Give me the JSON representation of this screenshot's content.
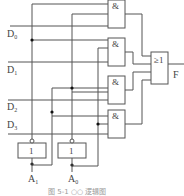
{
  "figure": {
    "caption": "图 5-1  ○○ 逻辑图",
    "colors": {
      "line": "#555555",
      "text": "#444444",
      "caption": "#9a9a9a",
      "background": "#ffffff"
    }
  },
  "inputs": {
    "data": [
      {
        "name": "D",
        "sub": "0"
      },
      {
        "name": "D",
        "sub": "1"
      },
      {
        "name": "D",
        "sub": "2"
      },
      {
        "name": "D",
        "sub": "3"
      }
    ],
    "select": [
      {
        "name": "A",
        "sub": "1"
      },
      {
        "name": "A",
        "sub": "0"
      }
    ]
  },
  "gates": {
    "and_symbol": "&",
    "or_symbol": "≥1",
    "not_symbol": "1",
    "and_count": 4,
    "not_count": 2
  },
  "output": {
    "name": "F"
  }
}
